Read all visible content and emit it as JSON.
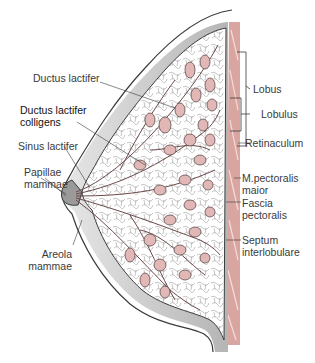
{
  "colors": {
    "skin": "#c9c9c9",
    "skin_dark": "#6f6f6f",
    "muscle": "#d9a5a0",
    "lobule_fill": "#e2b8b6",
    "duct": "#c99a98",
    "outline": "#3b3b3b",
    "label": "#3a3a3a"
  },
  "labels_left": [
    {
      "id": "ductus-lactifer",
      "lines": [
        "Ductus lactifer"
      ]
    },
    {
      "id": "ductus-lactifer-colligens",
      "lines": [
        "Ductus lactifer",
        "colligens"
      ]
    },
    {
      "id": "sinus-lactifer",
      "lines": [
        "Sinus lactifer"
      ]
    },
    {
      "id": "papillae-mammae",
      "lines": [
        "Papillae",
        "mammae"
      ]
    },
    {
      "id": "areola-mammae",
      "lines": [
        "Areola",
        "mammae"
      ]
    }
  ],
  "labels_right": [
    {
      "id": "lobus",
      "lines": [
        "Lobus"
      ]
    },
    {
      "id": "lobulus",
      "lines": [
        "Lobulus"
      ]
    },
    {
      "id": "retinaculum",
      "lines": [
        "Retinaculum"
      ]
    },
    {
      "id": "m-pectoralis-maior",
      "lines": [
        "M.pectoralis",
        "maior"
      ]
    },
    {
      "id": "fascia-pectoralis",
      "lines": [
        "Fascia",
        "pectoralis"
      ]
    },
    {
      "id": "septum-interlobulare",
      "lines": [
        "Septum",
        "interlobulare"
      ]
    }
  ]
}
